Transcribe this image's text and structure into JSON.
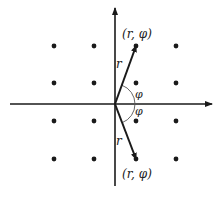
{
  "diagram": {
    "title": "",
    "origin": {
      "x": 115,
      "y": 104
    },
    "colors": {
      "ink": "#1a1a1a",
      "arc": "#555555",
      "background": "#ffffff"
    },
    "axes": {
      "horizontal": {
        "x1": 10,
        "x2": 212,
        "y": 104
      },
      "vertical": {
        "x": 115,
        "y1": 186,
        "y2": 8
      }
    },
    "lattice_points": [
      {
        "x": 54,
        "y": 46
      },
      {
        "x": 94,
        "y": 46
      },
      {
        "x": 136,
        "y": 46
      },
      {
        "x": 176,
        "y": 46
      },
      {
        "x": 54,
        "y": 83
      },
      {
        "x": 94,
        "y": 83
      },
      {
        "x": 136,
        "y": 83
      },
      {
        "x": 176,
        "y": 83
      },
      {
        "x": 54,
        "y": 121
      },
      {
        "x": 94,
        "y": 121
      },
      {
        "x": 136,
        "y": 121
      },
      {
        "x": 176,
        "y": 121
      },
      {
        "x": 54,
        "y": 159
      },
      {
        "x": 94,
        "y": 159
      },
      {
        "x": 136,
        "y": 159
      },
      {
        "x": 176,
        "y": 159
      }
    ],
    "vectors": [
      {
        "name": "upper",
        "to": {
          "x": 136,
          "y": 46
        },
        "length_label": "r",
        "point_label": "(r, φ)",
        "angle_label": "φ"
      },
      {
        "name": "lower",
        "to": {
          "x": 136,
          "y": 159
        },
        "length_label": "r",
        "point_label": "(r, φ)",
        "angle_label": "φ"
      }
    ]
  }
}
